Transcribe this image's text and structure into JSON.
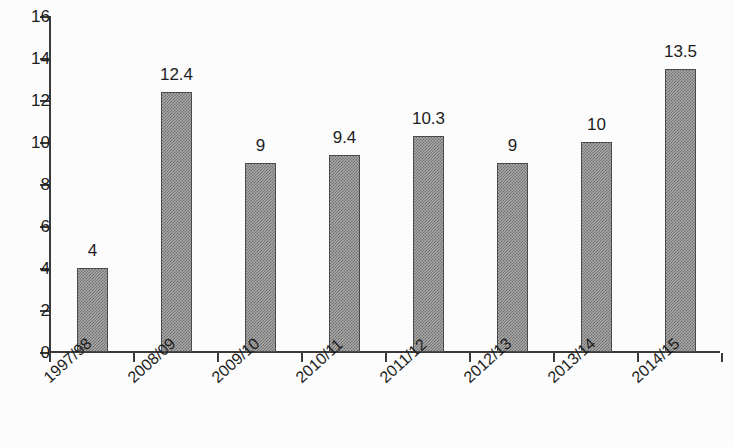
{
  "chart_data": {
    "type": "bar",
    "title": "",
    "subtitle": "",
    "xlabel": "",
    "ylabel": "",
    "categories": [
      "1997/98",
      "2008/09",
      "2009/10",
      "2010/11",
      "2011/12",
      "2012/13",
      "2013/14",
      "2014/15"
    ],
    "values": [
      4,
      12.4,
      9,
      9.4,
      10.3,
      9,
      10,
      13.5
    ],
    "data_labels": [
      "4",
      "12.4",
      "9",
      "9.4",
      "10.3",
      "9",
      "10",
      "13.5"
    ],
    "ylim": [
      0,
      16
    ],
    "y_ticks": [
      0,
      2,
      4,
      6,
      8,
      10,
      12,
      14,
      16
    ],
    "y_tick_labels": [
      "0",
      "2",
      "4",
      "6",
      "8",
      "10",
      "12",
      "14",
      "16"
    ],
    "grid": false,
    "legend": null,
    "legend_position": "none",
    "bar_fill": "#a8a8a8",
    "bar_edge": "#4a4a4a",
    "axis_color": "#3a3a3a",
    "text_color": "#1d1d1d",
    "background": "#fcfcfc",
    "category_label_rotation": -42
  }
}
